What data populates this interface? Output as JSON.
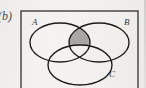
{
  "figure": {
    "part_label": "(b)",
    "caption_labels": {
      "set_a": "A",
      "set_b": "B",
      "set_c": "C"
    },
    "shaded_region_description": "(A ∩ B) \\ C",
    "colors": {
      "stroke": "#1d1b1a",
      "shade_fill": "#a9a7a4",
      "background": "#f3f1ef",
      "box_stroke": "#33312f",
      "label_text": "#3c3a38"
    },
    "geometry": {
      "box": {
        "x": 21,
        "y": 11,
        "width": 117,
        "height": 82
      },
      "circle_a": {
        "cx": 60,
        "cy": 42.5,
        "rx": 30,
        "ry": 19.5
      },
      "circle_b": {
        "cx": 99,
        "cy": 42.5,
        "rx": 30,
        "ry": 19.5
      },
      "circle_c": {
        "cx": 80,
        "cy": 65,
        "rx": 32,
        "ry": 20
      }
    }
  }
}
